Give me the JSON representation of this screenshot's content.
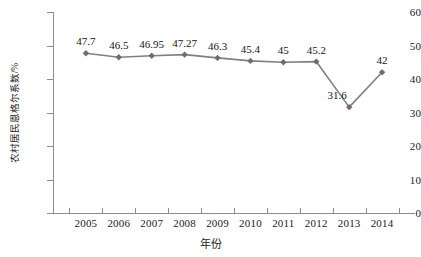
{
  "chart_data": {
    "type": "line",
    "title": "",
    "xlabel": "年份",
    "ylabel": "农村居民恩格尔系数/%",
    "categories": [
      "2005",
      "2006",
      "2007",
      "2008",
      "2009",
      "2010",
      "2011",
      "2012",
      "2013",
      "2014"
    ],
    "values": [
      47.7,
      46.5,
      46.95,
      47.27,
      46.3,
      45.4,
      45,
      45.2,
      31.6,
      42
    ],
    "value_labels": [
      "47.7",
      "46.5",
      "46.95",
      "47.27",
      "46.3",
      "45.4",
      "45",
      "45.2",
      "31.6",
      "42"
    ],
    "ylim": [
      0,
      60
    ],
    "ytick_labels": [
      "0",
      "10",
      "20",
      "30",
      "40",
      "50",
      "60"
    ],
    "ytick_values": [
      0,
      10,
      20,
      30,
      40,
      50,
      60
    ],
    "grid": false,
    "legend": "none",
    "series": [
      {
        "name": "农村居民恩格尔系数",
        "values": [
          47.7,
          46.5,
          46.95,
          47.27,
          46.3,
          45.4,
          45,
          45.2,
          31.6,
          42
        ],
        "color": "#808080",
        "marker": "diamond"
      }
    ],
    "colors": {
      "line": "#808080",
      "marker": "#6e6e6e",
      "axis": "#8d8d8d",
      "text": "#1a1a1a",
      "background": "#ffffff"
    },
    "label_offsets": [
      {
        "dx": 0,
        "dy": -17
      },
      {
        "dx": 0,
        "dy": -17
      },
      {
        "dx": 0,
        "dy": -17
      },
      {
        "dx": 0,
        "dy": -17
      },
      {
        "dx": 0,
        "dy": -17
      },
      {
        "dx": 0,
        "dy": -17
      },
      {
        "dx": 0,
        "dy": -17
      },
      {
        "dx": 0,
        "dy": -17
      },
      {
        "dx": -12,
        "dy": -17
      },
      {
        "dx": 0,
        "dy": -17
      }
    ]
  }
}
